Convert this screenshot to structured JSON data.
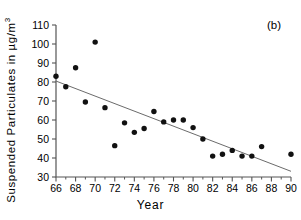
{
  "chart_data": {
    "type": "scatter",
    "title": "",
    "panel_label": "(b)",
    "xlabel": "Year",
    "ylabel": "Suspended Particulates in µg/m",
    "ylabel_superscript": "3",
    "xlim": [
      66,
      90
    ],
    "ylim": [
      30,
      110
    ],
    "xticks": [
      66,
      68,
      70,
      72,
      74,
      76,
      78,
      80,
      82,
      84,
      86,
      88,
      90
    ],
    "xticks_minor": [
      67,
      69,
      71,
      73,
      75,
      77,
      79,
      81,
      83,
      85,
      87,
      89
    ],
    "yticks": [
      30,
      40,
      50,
      60,
      70,
      80,
      90,
      100,
      110
    ],
    "grid": false,
    "legend": false,
    "marker_color": "#111111",
    "trendline_color": "#6b6b6b",
    "axis_color": "#555555",
    "x": [
      66,
      67,
      68,
      69,
      70,
      71,
      72,
      73,
      74,
      75,
      76,
      77,
      78,
      79,
      80,
      81,
      82,
      83,
      84,
      85,
      86,
      87,
      90
    ],
    "y": [
      83.0,
      77.5,
      87.5,
      69.5,
      101.0,
      66.5,
      46.5,
      58.5,
      53.5,
      55.5,
      64.5,
      59.0,
      60.0,
      60.0,
      56.0,
      50.0,
      41.0,
      42.0,
      44.0,
      41.0,
      41.0,
      46.0,
      42.0
    ],
    "series": [
      {
        "name": "Suspended Particulates",
        "points": [
          {
            "year": 66,
            "value": 83.0
          },
          {
            "year": 67,
            "value": 77.5
          },
          {
            "year": 68,
            "value": 87.5
          },
          {
            "year": 69,
            "value": 69.5
          },
          {
            "year": 70,
            "value": 101.0
          },
          {
            "year": 71,
            "value": 66.5
          },
          {
            "year": 72,
            "value": 46.5
          },
          {
            "year": 73,
            "value": 58.5
          },
          {
            "year": 74,
            "value": 53.5
          },
          {
            "year": 75,
            "value": 55.5
          },
          {
            "year": 76,
            "value": 64.5
          },
          {
            "year": 77,
            "value": 59.0
          },
          {
            "year": 78,
            "value": 60.0
          },
          {
            "year": 79,
            "value": 60.0
          },
          {
            "year": 80,
            "value": 56.0
          },
          {
            "year": 81,
            "value": 50.0
          },
          {
            "year": 82,
            "value": 41.0
          },
          {
            "year": 83,
            "value": 42.0
          },
          {
            "year": 84,
            "value": 44.0
          },
          {
            "year": 85,
            "value": 41.0
          },
          {
            "year": 86,
            "value": 41.0
          },
          {
            "year": 87,
            "value": 46.0
          },
          {
            "year": 90,
            "value": 42.0
          }
        ]
      }
    ],
    "trendline": {
      "x0": 66,
      "y0": 80.5,
      "x1": 90,
      "y1": 33.0
    }
  }
}
